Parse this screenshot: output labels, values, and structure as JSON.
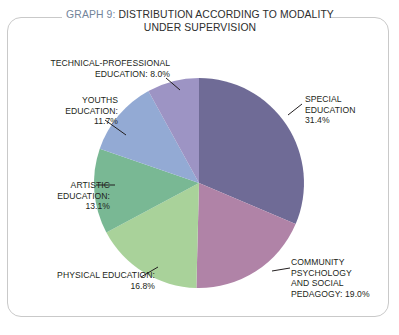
{
  "title": {
    "graph_number": "GRAPH 9:",
    "text": " DISTRIBUTION ACCORDING TO MODALITY UNDER SUPERVISION",
    "full": "GRAPH 9: DISTRIBUTION ACCORDING TO MODALITY UNDER SUPERVISION",
    "accent_color": "#73849a",
    "text_color": "#2d2d2d"
  },
  "labels": {
    "special": "SPECIAL\nEDUCATION\n31.4%",
    "community": "COMMUNITY\nPSYCHOLOGY\nAND SOCIAL\nPEDAGOGY: 19.0%",
    "physical": "PHYSICAL EDUCATION:\n16.8%",
    "artistic": "ARTISTIC\nEDUCATION:\n13.1%",
    "youths": "YOUTHS\nEDUCATION:\n11.7%",
    "technical": "TECHNICAL-PROFESSIONAL\nEDUCATION: 8.0%"
  },
  "chart_data": {
    "type": "pie",
    "title": "GRAPH 9: DISTRIBUTION ACCORDING TO MODALITY UNDER SUPERVISION",
    "xlabel": "",
    "ylabel": "",
    "grid": false,
    "legend": "none",
    "start_angle_deg": 0,
    "direction": "clockwise",
    "categories": [
      "SPECIAL EDUCATION",
      "COMMUNITY PSYCHOLOGY AND SOCIAL PEDAGOGY",
      "PHYSICAL EDUCATION",
      "ARTISTIC EDUCATION",
      "YOUTHS EDUCATION",
      "TECHNICAL-PROFESSIONAL EDUCATION"
    ],
    "values": [
      31.4,
      19.0,
      16.8,
      13.1,
      11.7,
      8.0
    ],
    "value_labels": [
      "31.4%",
      "19.0%",
      "16.8%",
      "13.1%",
      "11.7%",
      "8.0%"
    ],
    "colors": [
      "#6f6b96",
      "#b083a7",
      "#a9d29a",
      "#79b894",
      "#93aad4",
      "#9d94c4"
    ],
    "units": "percent",
    "total": 100.0
  },
  "geometry": {
    "cx": 199,
    "cy": 183,
    "r": 105
  }
}
